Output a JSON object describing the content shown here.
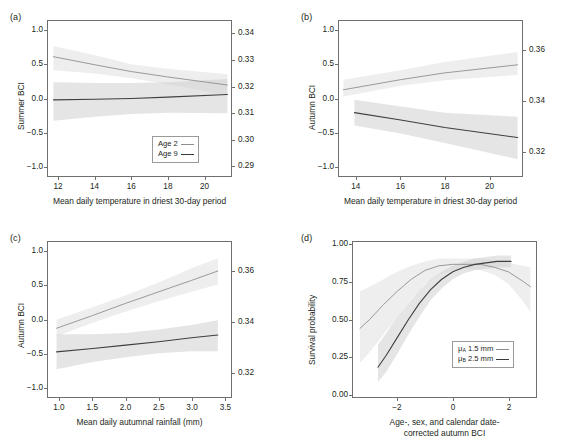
{
  "figure": {
    "background": "#ffffff",
    "line_dark_color": "#3f3f3f",
    "line_light_color": "#8e8e8e",
    "band_color": "#cfcfcf",
    "axis_color": "#6f6f6f"
  },
  "panels": [
    {
      "tag": "(a)",
      "ylabel": "Summer BCI",
      "xlabel": "Mean daily temperature in driest 30-day period",
      "yticks_left": [
        "1.0",
        "0.5",
        "0.0",
        "-0.5",
        "-1.0"
      ],
      "yticks_right": [
        "0.34",
        "0.33",
        "0.32",
        "0.31",
        "0.30",
        "0.29"
      ],
      "xticks": [
        "12",
        "14",
        "16",
        "18",
        "20"
      ],
      "legend": [
        {
          "label": "Age 2",
          "style": "light"
        },
        {
          "label": "Age 9",
          "style": "dark"
        }
      ]
    },
    {
      "tag": "(b)",
      "ylabel": "Autumn BCI",
      "xlabel": "Mean daily temperature in driest 30-day period",
      "yticks_left": [
        "1.0",
        "0.5",
        "0.0",
        "-0.5",
        "-1.0"
      ],
      "yticks_right": [
        "0.36",
        "0.34",
        "0.32"
      ],
      "xticks": [
        "14",
        "16",
        "18",
        "20"
      ],
      "legend": []
    },
    {
      "tag": "(c)",
      "ylabel": "Autumn BCI",
      "xlabel": "Mean daily autumnal rainfall (mm)",
      "yticks_left": [
        "1.0",
        "0.5",
        "0.0",
        "-0.5",
        "-1.0"
      ],
      "yticks_right": [
        "0.36",
        "0.34",
        "0.32"
      ],
      "xticks": [
        "1.0",
        "1.5",
        "2.0",
        "2.5",
        "3.0",
        "3.5"
      ],
      "legend": []
    },
    {
      "tag": "(d)",
      "ylabel": "Survival probability",
      "xlabel": "Age-, sex, and calendar date-\ncorrected autumn BCI",
      "yticks_left": [
        "1.00",
        "0.75",
        "0.50",
        "0.25",
        "0.00"
      ],
      "yticks_right": [],
      "xticks": [
        "-2",
        "0",
        "2"
      ],
      "legend": [
        {
          "label_pre": "μ",
          "label_sub": "A",
          "label_post": " 1.5 mm",
          "style": "light"
        },
        {
          "label_pre": "μ",
          "label_sub": "B",
          "label_post": " 2.5 mm",
          "style": "dark"
        }
      ]
    }
  ],
  "chart_data": [
    {
      "type": "line",
      "panel": "a",
      "title": "",
      "xlabel": "Mean daily temperature in driest 30-day period",
      "ylabel": "Summer BCI",
      "ylabel_right": "",
      "xlim": [
        11.4,
        21.5
      ],
      "ylim": [
        -1.15,
        1.15
      ],
      "ylim_right": [
        0.286,
        0.345
      ],
      "xticks": [
        12,
        14,
        16,
        18,
        20
      ],
      "yticks": [
        -1.0,
        -0.5,
        0.0,
        0.5,
        1.0
      ],
      "yticks_right": [
        0.29,
        0.3,
        0.31,
        0.32,
        0.33,
        0.34
      ],
      "grid": false,
      "legend_position": "bottom-right",
      "series": [
        {
          "name": "Age 2",
          "style": "light",
          "x": [
            11.7,
            14.0,
            16.0,
            18.0,
            21.3
          ],
          "y": [
            0.62,
            0.5,
            0.4,
            0.32,
            0.2
          ],
          "band_lo": [
            0.42,
            0.37,
            0.3,
            0.21,
            0.05
          ],
          "band_hi": [
            0.78,
            0.64,
            0.51,
            0.44,
            0.36
          ]
        },
        {
          "name": "Age 9",
          "style": "dark",
          "x": [
            11.7,
            14.0,
            16.0,
            18.0,
            21.3
          ],
          "y": [
            -0.02,
            -0.01,
            0.0,
            0.02,
            0.06
          ],
          "band_lo": [
            -0.33,
            -0.27,
            -0.23,
            -0.21,
            -0.22
          ],
          "band_hi": [
            0.24,
            0.23,
            0.23,
            0.24,
            0.29
          ]
        }
      ]
    },
    {
      "type": "line",
      "panel": "b",
      "title": "",
      "xlabel": "Mean daily temperature in driest 30-day period",
      "ylabel": "Autumn BCI",
      "xlim": [
        13.2,
        21.5
      ],
      "ylim": [
        -1.15,
        1.15
      ],
      "ylim_right": [
        0.31,
        0.372
      ],
      "xticks": [
        14,
        16,
        18,
        20
      ],
      "yticks": [
        -1.0,
        -0.5,
        0.0,
        0.5,
        1.0
      ],
      "yticks_right": [
        0.32,
        0.34,
        0.36
      ],
      "grid": false,
      "legend_position": "none",
      "series": [
        {
          "name": "Age 2",
          "style": "light",
          "x": [
            13.4,
            16.0,
            18.0,
            21.3
          ],
          "y": [
            0.13,
            0.28,
            0.38,
            0.5
          ],
          "band_lo": [
            0.03,
            0.19,
            0.27,
            0.35
          ],
          "band_hi": [
            0.28,
            0.42,
            0.54,
            0.69
          ]
        },
        {
          "name": "Age 9",
          "style": "dark",
          "x": [
            13.9,
            16.0,
            18.0,
            21.3
          ],
          "y": [
            -0.21,
            -0.32,
            -0.43,
            -0.58
          ],
          "band_lo": [
            -0.4,
            -0.52,
            -0.66,
            -0.9
          ],
          "band_hi": [
            -0.02,
            -0.12,
            -0.21,
            -0.27
          ]
        }
      ]
    },
    {
      "type": "line",
      "panel": "c",
      "title": "",
      "xlabel": "Mean daily autumnal rainfall (mm)",
      "ylabel": "Autumn BCI",
      "xlim": [
        0.82,
        3.6
      ],
      "ylim": [
        -1.15,
        1.15
      ],
      "ylim_right": [
        0.31,
        0.372
      ],
      "xticks": [
        1.0,
        1.5,
        2.0,
        2.5,
        3.0,
        3.5
      ],
      "yticks": [
        -1.0,
        -0.5,
        0.0,
        0.5,
        1.0
      ],
      "yticks_right": [
        0.32,
        0.34,
        0.36
      ],
      "grid": false,
      "legend_position": "none",
      "series": [
        {
          "name": "Age 2",
          "style": "light",
          "x": [
            0.95,
            1.5,
            2.0,
            2.5,
            3.0,
            3.4
          ],
          "y": [
            -0.13,
            0.06,
            0.24,
            0.41,
            0.58,
            0.72
          ],
          "band_lo": [
            -0.25,
            -0.05,
            0.12,
            0.27,
            0.41,
            0.52
          ],
          "band_hi": [
            0.0,
            0.18,
            0.36,
            0.55,
            0.76,
            0.91
          ]
        },
        {
          "name": "Age 9",
          "style": "dark",
          "x": [
            0.95,
            1.5,
            2.0,
            2.5,
            3.0,
            3.4
          ],
          "y": [
            -0.48,
            -0.43,
            -0.38,
            -0.33,
            -0.27,
            -0.23
          ],
          "band_lo": [
            -0.74,
            -0.63,
            -0.56,
            -0.5,
            -0.47,
            -0.47
          ],
          "band_hi": [
            -0.22,
            -0.22,
            -0.2,
            -0.15,
            -0.08,
            -0.01
          ]
        }
      ]
    },
    {
      "type": "line",
      "panel": "d",
      "title": "",
      "xlabel": "Age-, sex, and calendar date-corrected autumn BCI",
      "ylabel": "Survival probability",
      "xlim": [
        -3.6,
        3.0
      ],
      "ylim": [
        -0.02,
        1.02
      ],
      "xticks": [
        -2,
        0,
        2
      ],
      "yticks": [
        0.0,
        0.25,
        0.5,
        0.75,
        1.0
      ],
      "grid": false,
      "legend_position": "bottom-right",
      "series": [
        {
          "name": "μA 1.5 mm",
          "style": "light",
          "x": [
            -3.35,
            -3.0,
            -2.5,
            -2.0,
            -1.5,
            -1.0,
            -0.5,
            0.0,
            0.5,
            1.0,
            1.5,
            2.0,
            2.5,
            2.8
          ],
          "y": [
            0.44,
            0.5,
            0.6,
            0.69,
            0.77,
            0.83,
            0.86,
            0.87,
            0.87,
            0.87,
            0.85,
            0.82,
            0.76,
            0.72
          ],
          "band_lo": [
            0.21,
            0.28,
            0.4,
            0.52,
            0.64,
            0.74,
            0.8,
            0.83,
            0.84,
            0.83,
            0.8,
            0.74,
            0.63,
            0.55
          ],
          "band_hi": [
            0.69,
            0.72,
            0.77,
            0.82,
            0.86,
            0.89,
            0.91,
            0.91,
            0.91,
            0.91,
            0.9,
            0.88,
            0.86,
            0.85
          ]
        },
        {
          "name": "μB 2.5 mm",
          "style": "dark",
          "x": [
            -2.7,
            -2.4,
            -2.0,
            -1.6,
            -1.2,
            -0.8,
            -0.4,
            0.0,
            0.4,
            0.8,
            1.2,
            1.6,
            2.0,
            2.1
          ],
          "y": [
            0.18,
            0.26,
            0.38,
            0.5,
            0.61,
            0.7,
            0.77,
            0.82,
            0.85,
            0.87,
            0.88,
            0.89,
            0.89,
            0.89
          ],
          "band_lo": [
            0.08,
            0.15,
            0.27,
            0.4,
            0.52,
            0.63,
            0.71,
            0.77,
            0.81,
            0.83,
            0.84,
            0.85,
            0.85,
            0.85
          ],
          "band_hi": [
            0.33,
            0.41,
            0.52,
            0.61,
            0.7,
            0.77,
            0.82,
            0.86,
            0.89,
            0.91,
            0.92,
            0.93,
            0.93,
            0.93
          ]
        }
      ]
    }
  ]
}
